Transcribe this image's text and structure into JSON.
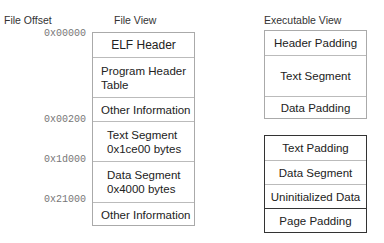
{
  "headers": {
    "file_offset": "File Offset",
    "file_view": "File View",
    "executable_view": "Executable View"
  },
  "offsets": [
    "0x00000",
    "0x00200",
    "0x1d000",
    "0x21000"
  ],
  "file_view": {
    "cells": [
      {
        "lines": [
          "ELF Header"
        ]
      },
      {
        "lines": [
          "Program Header",
          "Table"
        ]
      },
      {
        "lines": [
          "Other Information"
        ]
      },
      {
        "lines": [
          "Text Segment",
          "0x1ce00 bytes"
        ]
      },
      {
        "lines": [
          "Data Segment",
          "0x4000 bytes"
        ]
      },
      {
        "lines": [
          "Other Information"
        ]
      }
    ]
  },
  "executable_view": {
    "text_page": {
      "cells": [
        "Header Padding",
        "Text Segment",
        "Data Padding"
      ]
    },
    "data_page": {
      "cells": [
        "Text Padding",
        "Data Segment",
        "Uninitialized Data",
        "Page Padding"
      ]
    }
  }
}
